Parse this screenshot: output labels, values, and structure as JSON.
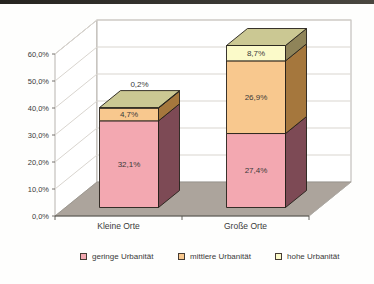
{
  "chart_data": {
    "type": "bar",
    "variant": "3d-stacked-column",
    "title": "",
    "xlabel": "",
    "ylabel": "",
    "categories": [
      "Kleine Orte",
      "Große Orte"
    ],
    "series": [
      {
        "name": "geringe Urbanität",
        "values": [
          32.1,
          27.4
        ],
        "labels": [
          "32,1%",
          "27,4%"
        ],
        "color": "#f3a8b1",
        "side_color": "#7d4a55"
      },
      {
        "name": "mittlere Urbanität",
        "values": [
          4.7,
          26.9
        ],
        "labels": [
          "4,7%",
          "26,9%"
        ],
        "color": "#f8c88e",
        "side_color": "#a5773d"
      },
      {
        "name": "hohe Urbanität",
        "values": [
          0.2,
          8.7
        ],
        "labels": [
          "0,2%",
          "8,7%"
        ],
        "color": "#fbfac9",
        "side_color": "#8f8459"
      }
    ],
    "ylim": [
      0,
      60
    ],
    "ytick_step": 10,
    "ytick_labels": [
      "0,0%",
      "10,0%",
      "20,0%",
      "30,0%",
      "40,0%",
      "50,0%",
      "60,0%"
    ],
    "grid": true,
    "legend_position": "bottom",
    "colors": {
      "bar_top_face": "#cbc893",
      "bar_border": "#241f18",
      "floor": "#aca49c",
      "wall_fill": "#ffffff",
      "wall_outline": "#b0aca6",
      "gridline": "#d9d5cf",
      "axis_line": "#55524c",
      "text": "#3a3a3a"
    }
  }
}
